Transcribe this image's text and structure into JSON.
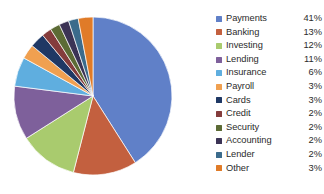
{
  "chart_data": {
    "type": "pie",
    "title": "",
    "legend_position": "right",
    "labels": [
      "Payments",
      "Banking",
      "Investing",
      "Lending",
      "Insurance",
      "Payroll",
      "Cards",
      "Credit",
      "Security",
      "Accounting",
      "Lender",
      "Other"
    ],
    "values": [
      41,
      13,
      12,
      11,
      6,
      3,
      3,
      2,
      2,
      2,
      2,
      3
    ],
    "value_labels": [
      "41%",
      "13%",
      "12%",
      "11%",
      "6%",
      "3%",
      "3%",
      "2%",
      "2%",
      "2%",
      "2%",
      "3%"
    ],
    "unit": "%",
    "start_angle_deg": 0,
    "direction": "clockwise",
    "colors": [
      "#6080C8",
      "#C3603F",
      "#A9CB6E",
      "#7E609B",
      "#5FAEDF",
      "#F0A050",
      "#1F3864",
      "#843C3C",
      "#5C6B35",
      "#3B3355",
      "#3B6B8C",
      "#E07B28"
    ],
    "series": [
      {
        "name": "Share",
        "points": [
          {
            "label": "Payments",
            "value": 41,
            "display": "41%",
            "color": "#6080C8"
          },
          {
            "label": "Banking",
            "value": 13,
            "display": "13%",
            "color": "#C3603F"
          },
          {
            "label": "Investing",
            "value": 12,
            "display": "12%",
            "color": "#A9CB6E"
          },
          {
            "label": "Lending",
            "value": 11,
            "display": "11%",
            "color": "#7E609B"
          },
          {
            "label": "Insurance",
            "value": 6,
            "display": "6%",
            "color": "#5FAEDF"
          },
          {
            "label": "Payroll",
            "value": 3,
            "display": "3%",
            "color": "#F0A050"
          },
          {
            "label": "Cards",
            "value": 3,
            "display": "3%",
            "color": "#1F3864"
          },
          {
            "label": "Credit",
            "value": 2,
            "display": "2%",
            "color": "#843C3C"
          },
          {
            "label": "Security",
            "value": 2,
            "display": "2%",
            "color": "#5C6B35"
          },
          {
            "label": "Accounting",
            "value": 2,
            "display": "2%",
            "color": "#3B3355"
          },
          {
            "label": "Lender",
            "value": 2,
            "display": "2%",
            "color": "#3B6B8C"
          },
          {
            "label": "Other",
            "value": 3,
            "display": "3%",
            "color": "#E07B28"
          }
        ]
      }
    ]
  },
  "legend": {
    "items": [
      {
        "label": "Payments",
        "value": "41%",
        "color": "#6080C8"
      },
      {
        "label": "Banking",
        "value": "13%",
        "color": "#C3603F"
      },
      {
        "label": "Investing",
        "value": "12%",
        "color": "#A9CB6E"
      },
      {
        "label": "Lending",
        "value": "11%",
        "color": "#7E609B"
      },
      {
        "label": "Insurance",
        "value": "6%",
        "color": "#5FAEDF"
      },
      {
        "label": "Payroll",
        "value": "3%",
        "color": "#F0A050"
      },
      {
        "label": "Cards",
        "value": "3%",
        "color": "#1F3864"
      },
      {
        "label": "Credit",
        "value": "2%",
        "color": "#843C3C"
      },
      {
        "label": "Security",
        "value": "2%",
        "color": "#5C6B35"
      },
      {
        "label": "Accounting",
        "value": "2%",
        "color": "#3B3355"
      },
      {
        "label": "Lender",
        "value": "2%",
        "color": "#3B6B8C"
      },
      {
        "label": "Other",
        "value": "3%",
        "color": "#E07B28"
      }
    ]
  },
  "pie_geometry": {
    "cx": 93,
    "cy": 96,
    "r": 79
  }
}
